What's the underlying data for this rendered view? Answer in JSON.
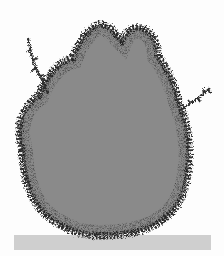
{
  "scene": {
    "subject": "shrub",
    "style": "grayscale illustration",
    "colors": {
      "background": "#fdfdfd",
      "foliage_fill": "#8a8a8a",
      "foliage_edge": "#2e2e2e",
      "ground": "#cfcfcf"
    }
  }
}
